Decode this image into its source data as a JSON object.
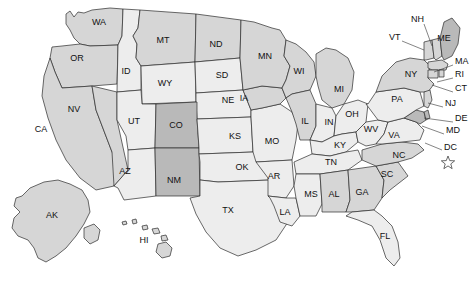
{
  "map": {
    "title": "United States state map",
    "background_color": "#ffffff",
    "border_color": "#2b2b2b",
    "shade_tiers": {
      "dark": "#b9b9b9",
      "medium": "#d6d6d6",
      "light": "#ededed"
    },
    "dc_marker": "hollow-star",
    "states": [
      {
        "code": "WA",
        "x": 99,
        "y": 23,
        "tier": "medium"
      },
      {
        "code": "OR",
        "x": 77,
        "y": 59,
        "tier": "medium"
      },
      {
        "code": "ID",
        "x": 126,
        "y": 72,
        "tier": "light"
      },
      {
        "code": "MT",
        "x": 163,
        "y": 41,
        "tier": "medium"
      },
      {
        "code": "ND",
        "x": 216,
        "y": 45,
        "tier": "medium"
      },
      {
        "code": "SD",
        "x": 222,
        "y": 76,
        "tier": "light"
      },
      {
        "code": "NE",
        "x": 228,
        "y": 101,
        "tier": "light"
      },
      {
        "code": "MN",
        "x": 265,
        "y": 57,
        "tier": "medium"
      },
      {
        "code": "WI",
        "x": 299,
        "y": 72,
        "tier": "medium"
      },
      {
        "code": "MI",
        "x": 339,
        "y": 90,
        "tier": "medium"
      },
      {
        "code": "IA",
        "x": 244,
        "y": 99,
        "tier": "medium"
      },
      {
        "code": "WY",
        "x": 165,
        "y": 84,
        "tier": "light"
      },
      {
        "code": "NV",
        "x": 74,
        "y": 110,
        "tier": "medium"
      },
      {
        "code": "UT",
        "x": 134,
        "y": 122,
        "tier": "light"
      },
      {
        "code": "CO",
        "x": 176,
        "y": 126,
        "tier": "dark"
      },
      {
        "code": "CA",
        "x": 41,
        "y": 130,
        "tier": "medium"
      },
      {
        "code": "KS",
        "x": 235,
        "y": 137,
        "tier": "light"
      },
      {
        "code": "MO",
        "x": 272,
        "y": 142,
        "tier": "light"
      },
      {
        "code": "IL",
        "x": 305,
        "y": 122,
        "tier": "medium"
      },
      {
        "code": "IN",
        "x": 329,
        "y": 123,
        "tier": "light"
      },
      {
        "code": "OH",
        "x": 352,
        "y": 115,
        "tier": "light"
      },
      {
        "code": "KY",
        "x": 340,
        "y": 146,
        "tier": "light"
      },
      {
        "code": "WV",
        "x": 371,
        "y": 130,
        "tier": "light"
      },
      {
        "code": "VA",
        "x": 394,
        "y": 136,
        "tier": "light"
      },
      {
        "code": "AZ",
        "x": 125,
        "y": 172,
        "tier": "light"
      },
      {
        "code": "NM",
        "x": 174,
        "y": 181,
        "tier": "dark"
      },
      {
        "code": "OK",
        "x": 242,
        "y": 168,
        "tier": "light"
      },
      {
        "code": "TX",
        "x": 228,
        "y": 211,
        "tier": "light"
      },
      {
        "code": "AR",
        "x": 274,
        "y": 177,
        "tier": "light"
      },
      {
        "code": "LA",
        "x": 285,
        "y": 213,
        "tier": "light"
      },
      {
        "code": "MS",
        "x": 311,
        "y": 195,
        "tier": "light"
      },
      {
        "code": "AL",
        "x": 334,
        "y": 195,
        "tier": "medium"
      },
      {
        "code": "TN",
        "x": 331,
        "y": 163,
        "tier": "light"
      },
      {
        "code": "GA",
        "x": 362,
        "y": 193,
        "tier": "medium"
      },
      {
        "code": "SC",
        "x": 387,
        "y": 175,
        "tier": "medium"
      },
      {
        "code": "NC",
        "x": 399,
        "y": 156,
        "tier": "medium"
      },
      {
        "code": "FL",
        "x": 385,
        "y": 237,
        "tier": "light"
      },
      {
        "code": "PA",
        "x": 397,
        "y": 100,
        "tier": "light"
      },
      {
        "code": "NY",
        "x": 411,
        "y": 75,
        "tier": "medium"
      },
      {
        "code": "ME",
        "x": 444,
        "y": 39,
        "tier": "dark"
      },
      {
        "code": "AK",
        "x": 52,
        "y": 216,
        "tier": "medium"
      },
      {
        "code": "HI",
        "x": 144,
        "y": 241,
        "tier": "medium"
      }
    ],
    "callout_labels": [
      {
        "code": "NH",
        "x": 411,
        "y": 20,
        "align": "start",
        "leader": [
          [
            424,
            24
          ],
          [
            432,
            46
          ]
        ]
      },
      {
        "code": "VT",
        "x": 389,
        "y": 38,
        "align": "start",
        "leader": [
          [
            402,
            41
          ],
          [
            424,
            50
          ]
        ]
      },
      {
        "code": "MA",
        "x": 455,
        "y": 62,
        "align": "start",
        "leader": [
          [
            453,
            65
          ],
          [
            434,
            72
          ]
        ]
      },
      {
        "code": "RI",
        "x": 455,
        "y": 75,
        "align": "start",
        "leader": [
          [
            453,
            78
          ],
          [
            437,
            82
          ]
        ]
      },
      {
        "code": "CT",
        "x": 455,
        "y": 89,
        "align": "start",
        "leader": [
          [
            453,
            92
          ],
          [
            432,
            85
          ]
        ]
      },
      {
        "code": "NJ",
        "x": 445,
        "y": 104,
        "align": "start",
        "leader": [
          [
            443,
            107
          ],
          [
            428,
            103
          ]
        ]
      },
      {
        "code": "DE",
        "x": 455,
        "y": 119,
        "align": "start",
        "leader": [
          [
            453,
            122
          ],
          [
            424,
            118
          ]
        ]
      },
      {
        "code": "MD",
        "x": 446,
        "y": 131,
        "align": "start",
        "leader": [
          [
            444,
            134
          ],
          [
            422,
            126
          ]
        ]
      },
      {
        "code": "DC",
        "x": 444,
        "y": 148,
        "align": "start",
        "leader": [
          [
            442,
            150
          ],
          [
            425,
            143
          ]
        ]
      }
    ],
    "dc_star": {
      "x": 448,
      "y": 163,
      "size": 7
    }
  }
}
